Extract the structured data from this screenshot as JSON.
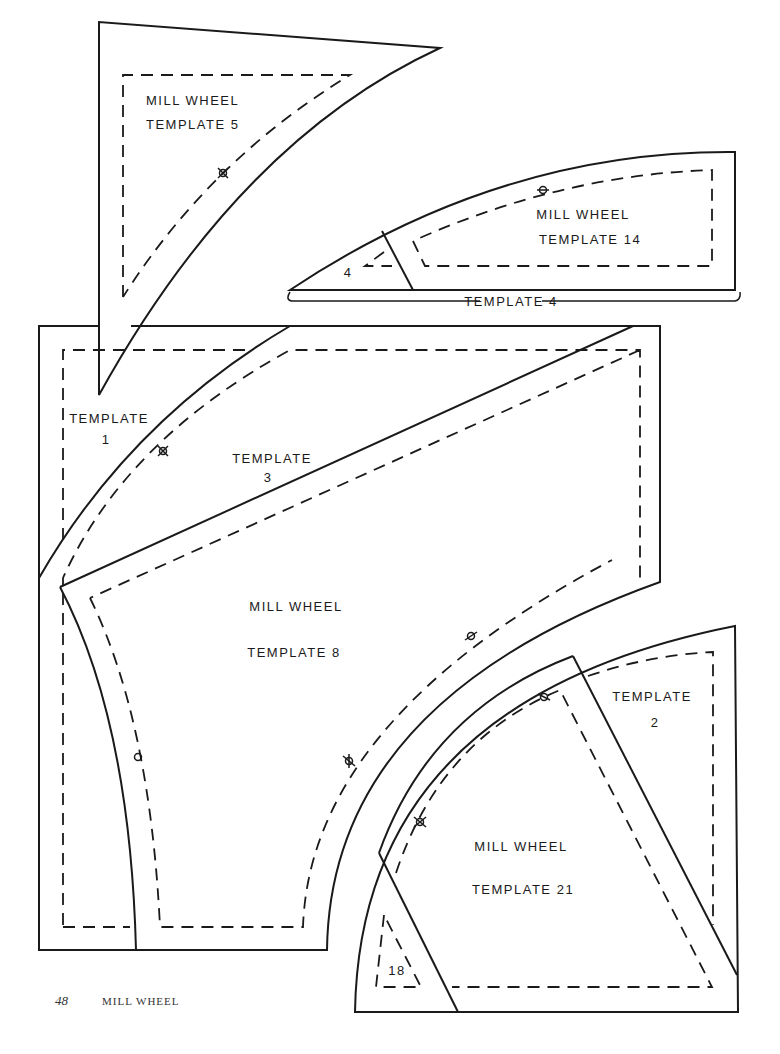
{
  "page": {
    "number": "48",
    "running_title": "MILL WHEEL"
  },
  "templates": {
    "t5": {
      "line1": "MILL WHEEL",
      "line2": "TEMPLATE 5"
    },
    "t14": {
      "line1": "MILL WHEEL",
      "line2": "TEMPLATE 14"
    },
    "t4_small": {
      "label": "4"
    },
    "t4_bracket": {
      "label": "TEMPLATE 4"
    },
    "t1": {
      "line1": "TEMPLATE",
      "line2": "1"
    },
    "t3": {
      "line1": "TEMPLATE",
      "line2": "3"
    },
    "t8": {
      "line1": "MILL WHEEL",
      "line2": "TEMPLATE 8"
    },
    "t2": {
      "line1": "TEMPLATE",
      "line2": "2"
    },
    "t21": {
      "line1": "MILL WHEEL",
      "line2": "TEMPLATE 21"
    },
    "t18": {
      "label": "18"
    }
  },
  "colors": {
    "line": "#1a1a1a",
    "background": "#ffffff"
  }
}
